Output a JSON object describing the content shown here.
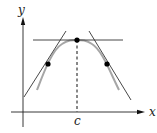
{
  "diagram": {
    "type": "function-graph",
    "axes": {
      "x_label": "x",
      "y_label": "y"
    },
    "marked_x_value": "c",
    "points": [
      {
        "name": "left-point",
        "tangent": "positive slope"
      },
      {
        "name": "maximum-point",
        "tangent": "horizontal (slope 0)"
      },
      {
        "name": "right-point",
        "tangent": "negative slope"
      }
    ],
    "colors": {
      "axes": "#222222",
      "curve": "#a6a6a6",
      "tangents": "#333333",
      "points": "#000000"
    }
  }
}
